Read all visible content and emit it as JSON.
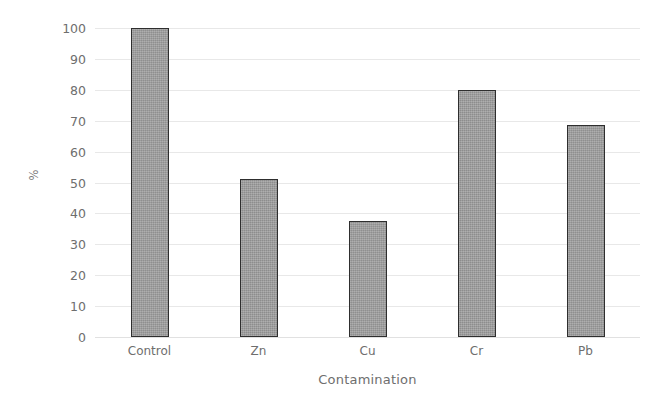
{
  "chart_data": {
    "type": "bar",
    "title": "",
    "categories": [
      "Control",
      "Zn",
      "Cu",
      "Cr",
      "Pb"
    ],
    "values": [
      100,
      51,
      37.5,
      80,
      68.5
    ],
    "xlabel": "Contamination",
    "ylabel": "%",
    "ylim": [
      0,
      100
    ],
    "yticks": [
      0,
      10,
      20,
      30,
      40,
      50,
      60,
      70,
      80,
      90,
      100
    ],
    "ytick_labels": [
      "0",
      "10",
      "20",
      "30",
      "40",
      "50",
      "60",
      "70",
      "80",
      "90",
      "100"
    ],
    "grid": true,
    "legend": false,
    "bar_color": "#9c9c9c",
    "bar_edge_color": "#2e2e2e",
    "gridline_color": "#e6e6e6",
    "background_color": "#ffffff",
    "text_color": "#6e6e6e"
  }
}
